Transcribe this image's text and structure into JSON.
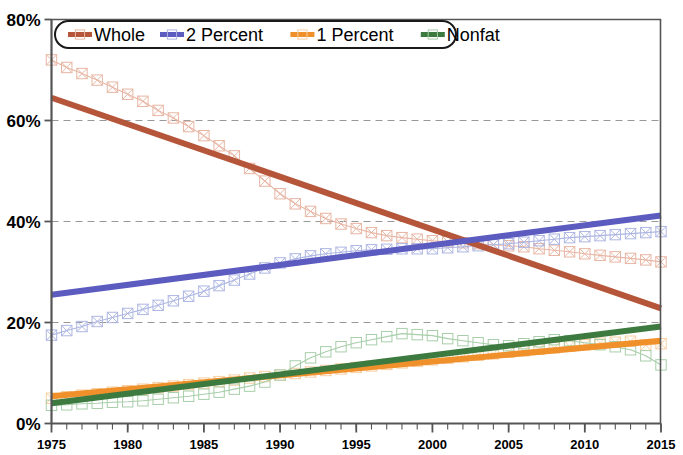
{
  "chart_data": {
    "type": "line",
    "title": "",
    "subtitle": "",
    "xlabel": "",
    "ylabel": "",
    "xlim": [
      1975,
      2015
    ],
    "ylim": [
      0,
      80
    ],
    "grid": true,
    "grid_axis": "y",
    "legend_position": "top-inside",
    "y_ticks": [
      0,
      20,
      40,
      60,
      80
    ],
    "y_tick_labels": [
      "0%",
      "20%",
      "40%",
      "60%",
      "80%"
    ],
    "x_ticks": [
      1975,
      1980,
      1985,
      1990,
      1995,
      2000,
      2005,
      2010,
      2015
    ],
    "x_tick_labels": [
      "1975",
      "1980",
      "1985",
      "1990",
      "1995",
      "2000",
      "2005",
      "2010",
      "2015"
    ],
    "x_minor_tick_interval": 1,
    "x": [
      1975,
      1976,
      1977,
      1978,
      1979,
      1980,
      1981,
      1982,
      1983,
      1984,
      1985,
      1986,
      1987,
      1988,
      1989,
      1990,
      1991,
      1992,
      1993,
      1994,
      1995,
      1996,
      1997,
      1998,
      1999,
      2000,
      2001,
      2002,
      2003,
      2004,
      2005,
      2006,
      2007,
      2008,
      2009,
      2010,
      2011,
      2012,
      2013,
      2014,
      2015
    ],
    "series": [
      {
        "name": "Whole",
        "color": "#b5553a",
        "marker": "x-square",
        "data_color": "#e8b6a4",
        "trend": {
          "start_year": 1975,
          "start_value": 64.5,
          "end_year": 2015,
          "end_value": 22.8
        },
        "values": [
          72.0,
          70.5,
          69.3,
          68.0,
          66.6,
          65.2,
          63.8,
          62.0,
          60.5,
          58.8,
          57.0,
          55.0,
          53.0,
          50.5,
          48.0,
          45.5,
          43.5,
          42.0,
          40.6,
          39.5,
          38.6,
          37.8,
          37.2,
          36.8,
          36.5,
          36.2,
          36.0,
          35.8,
          35.6,
          35.4,
          35.2,
          35.0,
          34.6,
          34.3,
          34.0,
          33.6,
          33.3,
          33.0,
          32.7,
          32.4,
          32.0
        ]
      },
      {
        "name": "2 Percent",
        "color": "#5b5bc0",
        "marker": "x-square",
        "data_color": "#aeb6e2",
        "trend": {
          "start_year": 1975,
          "start_value": 25.5,
          "end_year": 2015,
          "end_value": 41.2
        },
        "values": [
          17.5,
          18.4,
          19.2,
          20.2,
          21.0,
          21.8,
          22.6,
          23.4,
          24.3,
          25.2,
          26.2,
          27.3,
          28.4,
          29.6,
          30.8,
          31.8,
          32.6,
          33.2,
          33.6,
          33.9,
          34.2,
          34.4,
          34.5,
          34.6,
          34.6,
          34.6,
          34.8,
          35.0,
          35.2,
          35.4,
          35.6,
          35.9,
          36.2,
          36.5,
          36.8,
          37.0,
          37.2,
          37.4,
          37.6,
          37.8,
          38.0
        ]
      },
      {
        "name": "1 Percent",
        "color": "#f0902a",
        "marker": "x-square",
        "data_color": "#f7cfa3",
        "trend": {
          "start_year": 1975,
          "start_value": 5.4,
          "end_year": 2015,
          "end_value": 16.4
        },
        "values": [
          5.0,
          5.3,
          5.6,
          5.9,
          6.2,
          6.5,
          6.8,
          7.1,
          7.4,
          7.7,
          8.0,
          8.3,
          8.6,
          9.0,
          9.3,
          9.6,
          9.9,
          10.2,
          10.5,
          10.8,
          11.1,
          11.4,
          11.7,
          12.0,
          12.3,
          12.6,
          12.9,
          13.2,
          13.5,
          13.8,
          14.1,
          14.4,
          14.7,
          15.0,
          15.3,
          15.6,
          15.9,
          16.1,
          16.3,
          15.5,
          15.8
        ]
      },
      {
        "name": "Nonfat",
        "color": "#3d7a40",
        "marker": "square",
        "data_color": "#a8ceaa",
        "trend": {
          "start_year": 1975,
          "start_value": 4.0,
          "end_year": 2015,
          "end_value": 19.2
        },
        "values": [
          3.6,
          3.7,
          3.9,
          4.0,
          4.2,
          4.3,
          4.5,
          4.8,
          5.1,
          5.4,
          5.8,
          6.2,
          6.8,
          7.4,
          8.2,
          9.6,
          11.4,
          13.0,
          14.2,
          15.2,
          16.0,
          16.6,
          17.2,
          17.8,
          17.6,
          17.4,
          16.8,
          16.4,
          16.0,
          15.6,
          15.4,
          15.8,
          16.2,
          16.6,
          16.4,
          16.0,
          15.6,
          15.2,
          14.6,
          13.4,
          11.6
        ]
      }
    ],
    "legend": [
      {
        "label": "Whole",
        "color": "#b5553a"
      },
      {
        "label": "2 Percent",
        "color": "#5b5bc0"
      },
      {
        "label": "1 Percent",
        "color": "#f0902a"
      },
      {
        "label": "Nonfat",
        "color": "#3d7a40"
      }
    ]
  },
  "axis": {
    "axis_color": "#555555",
    "grid_color": "#999999",
    "background": "#ffffff"
  }
}
